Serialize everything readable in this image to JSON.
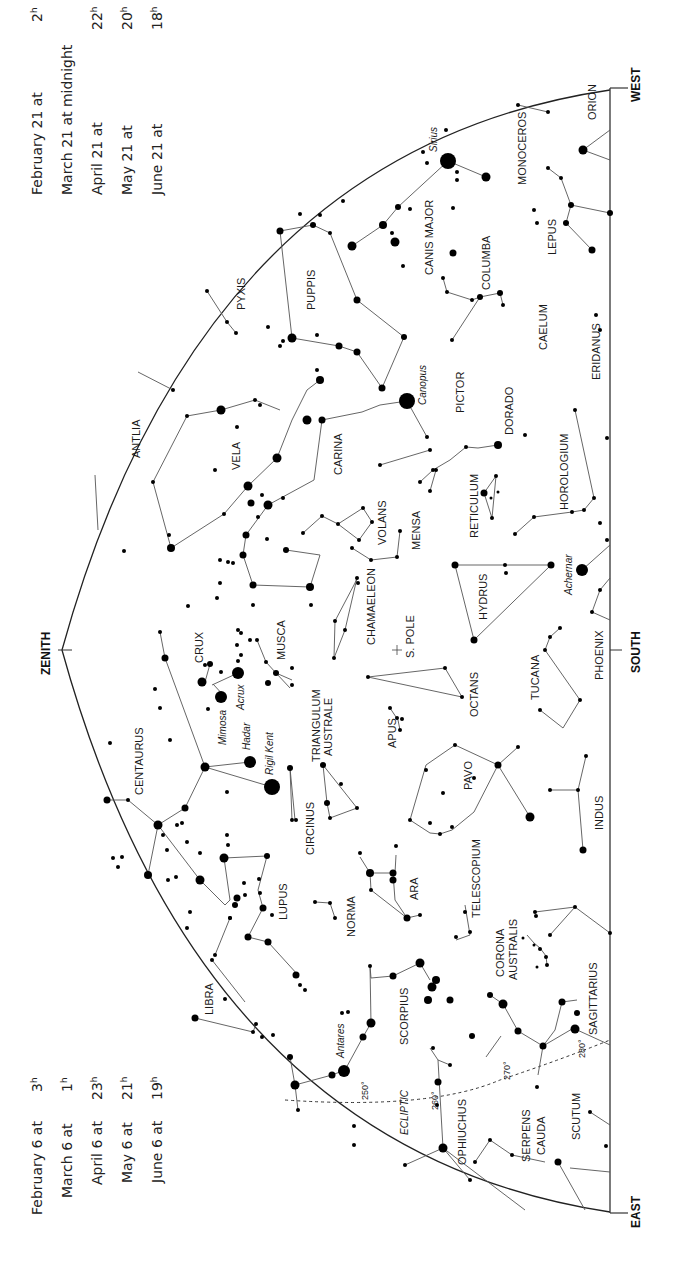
{
  "chart": {
    "directions": {
      "west": "WEST",
      "east": "EAST",
      "south": "SOUTH",
      "zenith": "ZENITH"
    },
    "pole_label": "S. POLE",
    "ecliptic_label": "ECLIPTIC",
    "ecliptic_degrees": [
      "250°",
      "260°",
      "270°",
      "280°"
    ]
  },
  "times_top": [
    {
      "date": "February 21 at",
      "time": "2",
      "unit": "h"
    },
    {
      "date": "March 21 at midnight",
      "time": "",
      "unit": ""
    },
    {
      "date": "April 21 at",
      "time": "22",
      "unit": "h"
    },
    {
      "date": "May 21 at",
      "time": "20",
      "unit": "h"
    },
    {
      "date": "June 21 at",
      "time": "18",
      "unit": "h"
    }
  ],
  "times_bottom": [
    {
      "date": "February 6 at",
      "time": "3",
      "unit": "h"
    },
    {
      "date": "March 6 at",
      "time": "1",
      "unit": "h"
    },
    {
      "date": "April 6 at",
      "time": "23",
      "unit": "h"
    },
    {
      "date": "May 6 at",
      "time": "21",
      "unit": "h"
    },
    {
      "date": "June 6 at",
      "time": "19",
      "unit": "h"
    }
  ],
  "constellations": {
    "orion": "ORION",
    "monoceros": "MONOCEROS",
    "lepus": "LEPUS",
    "canis_major": "CANIS MAJOR",
    "columba": "COLUMBA",
    "caelum": "CAELUM",
    "eridanus": "ERIDANUS",
    "puppis": "PUPPIS",
    "pyxis": "PYXIS",
    "pictor": "PICTOR",
    "dorado": "DORADO",
    "horologium": "HOROLOGIUM",
    "antlia": "ANTLIA",
    "vela": "VELA",
    "carina": "CARINA",
    "reticulum": "RETICULUM",
    "volans": "VOLANS",
    "mensa": "MENSA",
    "hydrus": "HYDRUS",
    "chamaeleon": "CHAMAELEON",
    "crux": "CRUX",
    "musca": "MUSCA",
    "octans": "OCTANS",
    "tucana": "TUCANA",
    "phoenix": "PHOENIX",
    "centaurus": "CENTAURUS",
    "triangulum_australe_1": "TRIANGULUM",
    "triangulum_australe_2": "AUSTRALE",
    "apus": "APUS",
    "pavo": "PAVO",
    "indus": "INDUS",
    "circinus": "CIRCINUS",
    "lupus": "LUPUS",
    "norma": "NORMA",
    "ara": "ARA",
    "telescopium": "TELESCOPIUM",
    "corona_australis_1": "CORONA",
    "corona_australis_2": "AUSTRALIS",
    "sagittarius": "SAGITTARIUS",
    "libra": "LIBRA",
    "scorpius": "SCORPIUS",
    "ophiuchus": "OPHIUCHUS",
    "serpens_cauda_1": "SERPENS",
    "serpens_cauda_2": "CAUDA",
    "scutum": "SCUTUM"
  },
  "stars": {
    "sirius": "Sirius",
    "canopus": "Canopus",
    "achernar": "Achernar",
    "acrux": "Acrux",
    "mimosa": "Mimosa",
    "hadar": "Hadar",
    "rigil_kent": "Rigil Kent",
    "antares": "Antares"
  }
}
